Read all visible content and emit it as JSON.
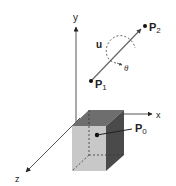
{
  "diagram": {
    "axes": {
      "x_label": "x",
      "y_label": "y",
      "z_label": "z"
    },
    "points": {
      "p0_label": "P",
      "p0_sub": "0",
      "p1_label": "P",
      "p1_sub": "1",
      "p2_label": "P",
      "p2_sub": "2"
    },
    "vector_label": "u",
    "angle_label": "θ",
    "colors": {
      "axis": "#555555",
      "cube_top": "#6e6e6e",
      "cube_front": "#c8c8c8",
      "cube_right": "#4a4a4a",
      "vector": "#666666",
      "point": "#111111"
    }
  }
}
